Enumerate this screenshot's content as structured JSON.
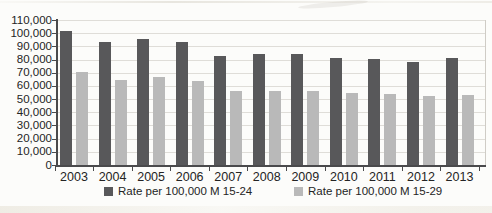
{
  "figure": {
    "kind": "scanned printed bar chart",
    "title": ""
  },
  "chart_data": {
    "type": "bar",
    "title": "",
    "xlabel": "",
    "ylabel": "",
    "categories": [
      "2003",
      "2004",
      "2005",
      "2006",
      "2007",
      "2008",
      "2009",
      "2010",
      "2011",
      "2012",
      "2013"
    ],
    "series": [
      {
        "name": "Rate per 100,000 M 15-24",
        "color": "#58585a",
        "values": [
          102000,
          93000,
          95500,
          93000,
          83000,
          84500,
          84000,
          81000,
          80500,
          78500,
          81000
        ]
      },
      {
        "name": "Rate per 100,000 M 15-29",
        "color": "#b9b9b9",
        "values": [
          70500,
          64500,
          66500,
          64000,
          56500,
          56500,
          56500,
          54500,
          54000,
          52000,
          53000
        ]
      }
    ],
    "y_axis": {
      "min": 0,
      "max": 110000,
      "step": 10000,
      "tick_labels": [
        "0",
        "10,000",
        "20,000",
        "30,000",
        "40,000",
        "50,000",
        "60,000",
        "70,000",
        "80,000",
        "90,000",
        "100,000",
        "110,000"
      ]
    },
    "legend_position": "bottom",
    "grid": true
  },
  "colors": {
    "background": "#fcfcfa",
    "gridline": "#dfddd8",
    "axis": "#4a4a4c",
    "text": "#242424",
    "plot_right_border": "#cfccc6"
  }
}
